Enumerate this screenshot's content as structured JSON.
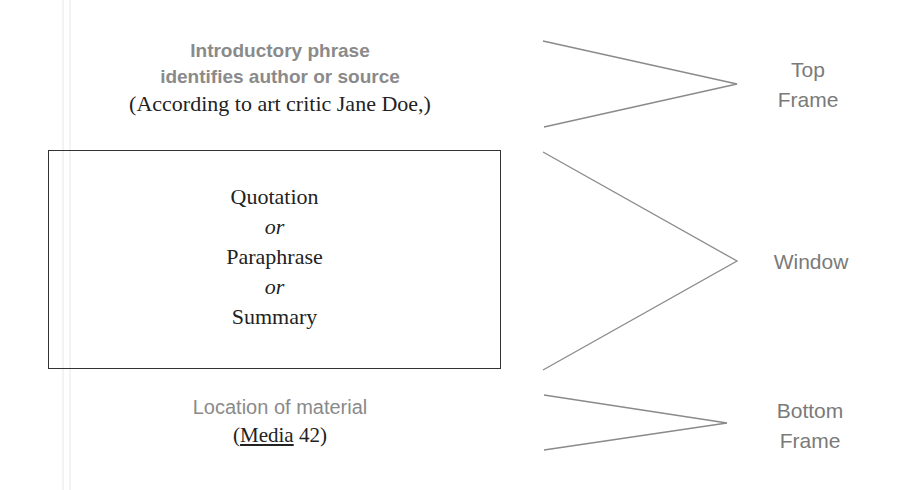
{
  "diagram": {
    "top_frame": {
      "intro_line1": "Introductory phrase",
      "intro_line2": "identifies author or source",
      "example": "(According to art critic Jane Doe,)",
      "label_line1": "Top",
      "label_line2": "Frame"
    },
    "window": {
      "items": [
        "Quotation",
        "or",
        "Paraphrase",
        "or",
        "Summary"
      ],
      "label": "Window"
    },
    "bottom_frame": {
      "location_text": "Location of material",
      "citation_open": "(",
      "citation_title": "Media",
      "citation_page": " 42)",
      "label_line1": "Bottom",
      "label_line2": "Frame"
    },
    "colors": {
      "label_gray": "#7a7a7a",
      "text_dark": "#222222",
      "line_gray": "#8a8a8a",
      "box_border": "#333333"
    }
  }
}
